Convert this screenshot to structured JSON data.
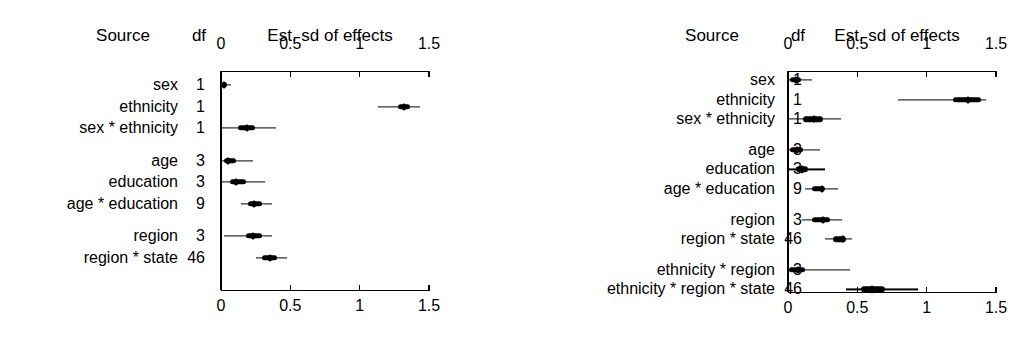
{
  "figure": {
    "headers": {
      "source": "Source",
      "df": "df",
      "scale": "Est. sd of effects"
    },
    "axis": {
      "min": 0,
      "max": 1.5,
      "ticks": [
        0,
        0.5,
        1,
        1.5
      ],
      "tick_labels": [
        "0",
        "0.5",
        "1",
        "1.5"
      ]
    }
  },
  "chart_data": [
    {
      "type": "interval",
      "panel": "left",
      "title": "Est. sd of effects",
      "xlabel": "",
      "ylabel": "Source",
      "xlim": [
        0,
        1.5
      ],
      "ticks": [
        0,
        0.5,
        1,
        1.5
      ],
      "tick_labels": [
        "0",
        "0.5",
        "1",
        "1.5"
      ],
      "grid": false,
      "axes": "top and bottom",
      "columns": [
        "Source",
        "df",
        "Est. sd of effects"
      ],
      "rows": [
        {
          "source": "sex",
          "df": "1",
          "median": 0.025,
          "inner_lo": 0.008,
          "inner_hi": 0.043,
          "outer_lo": 0.0,
          "outer_hi": 0.072,
          "group": 1
        },
        {
          "source": "ethnicity",
          "df": "1",
          "median": 1.32,
          "inner_lo": 1.275,
          "inner_hi": 1.365,
          "outer_lo": 1.13,
          "outer_hi": 1.435,
          "group": 1
        },
        {
          "source": "sex * ethnicity",
          "df": "1",
          "median": 0.185,
          "inner_lo": 0.12,
          "inner_hi": 0.248,
          "outer_lo": 0.005,
          "outer_hi": 0.4,
          "group": 1
        },
        {
          "source": "age",
          "df": "3",
          "median": 0.05,
          "inner_lo": 0.022,
          "inner_hi": 0.108,
          "outer_lo": 0.0,
          "outer_hi": 0.23,
          "group": 2
        },
        {
          "source": "education",
          "df": "3",
          "median": 0.105,
          "inner_lo": 0.065,
          "inner_hi": 0.18,
          "outer_lo": 0.003,
          "outer_hi": 0.318,
          "group": 2
        },
        {
          "source": "age * education",
          "df": "9",
          "median": 0.235,
          "inner_lo": 0.195,
          "inner_hi": 0.295,
          "outer_lo": 0.144,
          "outer_hi": 0.368,
          "group": 2
        },
        {
          "source": "region",
          "df": "3",
          "median": 0.23,
          "inner_lo": 0.18,
          "inner_hi": 0.295,
          "outer_lo": 0.022,
          "outer_hi": 0.368,
          "group": 3
        },
        {
          "source": "region * state",
          "df": "46",
          "median": 0.35,
          "inner_lo": 0.296,
          "inner_hi": 0.403,
          "outer_lo": 0.252,
          "outer_hi": 0.475,
          "group": 3
        }
      ]
    },
    {
      "type": "interval",
      "panel": "right",
      "title": "Est. sd of effects",
      "xlabel": "",
      "ylabel": "Source",
      "xlim": [
        0,
        1.5
      ],
      "ticks": [
        0,
        0.5,
        1,
        1.5
      ],
      "tick_labels": [
        "0",
        "0.5",
        "1",
        "1.5"
      ],
      "grid": false,
      "axes": "top and bottom",
      "columns": [
        "Source",
        "df",
        "Est. sd of effects"
      ],
      "rows": [
        {
          "source": "sex",
          "df": "1",
          "median": 0.055,
          "inner_lo": 0.018,
          "inner_hi": 0.092,
          "outer_lo": 0.0,
          "outer_hi": 0.175,
          "group": 1
        },
        {
          "source": "ethnicity",
          "df": "1",
          "median": 1.3,
          "inner_lo": 1.19,
          "inner_hi": 1.395,
          "outer_lo": 0.795,
          "outer_hi": 1.43,
          "group": 1
        },
        {
          "source": "sex * ethnicity",
          "df": "1",
          "median": 0.185,
          "inner_lo": 0.11,
          "inner_hi": 0.255,
          "outer_lo": 0.003,
          "outer_hi": 0.38,
          "group": 1
        },
        {
          "source": "age",
          "df": "3",
          "median": 0.062,
          "inner_lo": 0.018,
          "inner_hi": 0.11,
          "outer_lo": 0.0,
          "outer_hi": 0.23,
          "group": 2
        },
        {
          "source": "education",
          "df": "3",
          "median": 0.098,
          "inner_lo": 0.055,
          "inner_hi": 0.145,
          "outer_lo": 0.003,
          "outer_hi": 0.268,
          "group": 2
        },
        {
          "source": "age * education",
          "df": "9",
          "median": 0.245,
          "inner_lo": 0.176,
          "inner_hi": 0.27,
          "outer_lo": 0.124,
          "outer_hi": 0.362,
          "group": 2
        },
        {
          "source": "region",
          "df": "3",
          "median": 0.25,
          "inner_lo": 0.175,
          "inner_hi": 0.305,
          "outer_lo": 0.1,
          "outer_hi": 0.392,
          "group": 3
        },
        {
          "source": "region * state",
          "df": "46",
          "median": 0.395,
          "inner_lo": 0.325,
          "inner_hi": 0.415,
          "outer_lo": 0.268,
          "outer_hi": 0.462,
          "group": 3
        },
        {
          "source": "ethnicity * region",
          "df": "3",
          "median": 0.072,
          "inner_lo": 0.008,
          "inner_hi": 0.125,
          "outer_lo": 0.0,
          "outer_hi": 0.448,
          "group": 4
        },
        {
          "source": "ethnicity * region * state",
          "df": "46",
          "median": 0.605,
          "inner_lo": 0.53,
          "inner_hi": 0.7,
          "outer_lo": 0.42,
          "outer_hi": 0.94,
          "group": 4
        }
      ]
    }
  ]
}
